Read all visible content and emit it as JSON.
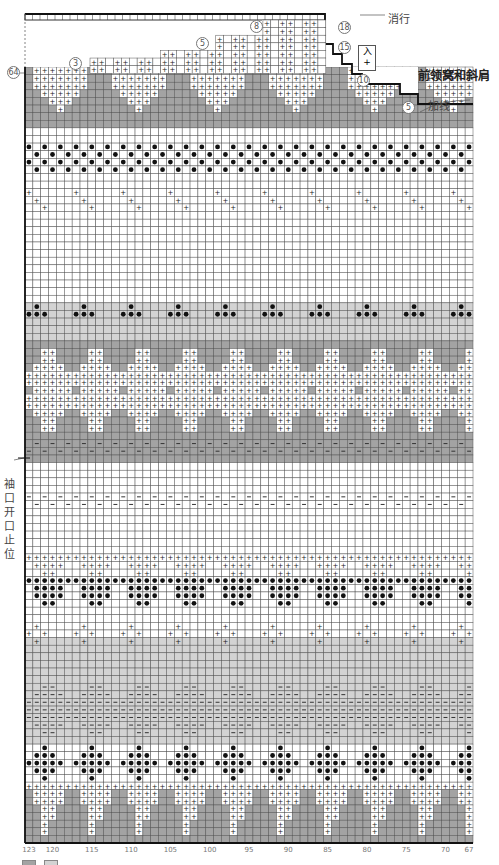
{
  "title": "前领窝和斜肩",
  "labels": {
    "bind_off_rows": "消行",
    "pick_up": "加线",
    "armhole_mark": "袖口开口止位"
  },
  "row_markers": [
    {
      "id": "m18",
      "text": "18"
    },
    {
      "id": "m15",
      "text": "15"
    },
    {
      "id": "m10",
      "text": "10"
    },
    {
      "id": "m5r",
      "text": "5"
    },
    {
      "id": "m8",
      "text": "8"
    },
    {
      "id": "m5",
      "text": "5"
    },
    {
      "id": "m3",
      "text": "3"
    },
    {
      "id": "m64",
      "text": "64"
    }
  ],
  "decrease_symbol": {
    "top": "入",
    "bottom": "+"
  },
  "stitch_numbers": [
    "123",
    "120",
    "115",
    "110",
    "105",
    "100",
    "95",
    "90",
    "85",
    "80",
    "75",
    "70",
    "67"
  ],
  "colors": {
    "dark_gray": "#a3a3a3",
    "light_gray": "#d3d3d3",
    "white": "#ffffff",
    "grid_line": "#555555",
    "dot": "#111111"
  },
  "symbols": {
    "plus": "+",
    "dot": "●",
    "dash": "−"
  },
  "chart_data": {
    "type": "heatmap",
    "columns": {
      "from": 123,
      "to": 67,
      "count": 57
    },
    "bands": [
      {
        "name": "bottom-diamonds",
        "background": "dark_gray",
        "motif": "white plus triangles"
      },
      {
        "name": "dot-diamonds",
        "background": "light_gray",
        "motif": "black dot diamonds"
      },
      {
        "name": "dash-waves",
        "background": "light_gray",
        "motif": "dash chevrons"
      },
      {
        "name": "plus-zigzag-lower",
        "background": "white",
        "motif": "plus zigzag"
      },
      {
        "name": "dot-waves",
        "background": "white",
        "motif": "black dot and plus waves"
      },
      {
        "name": "dash-rows",
        "background": "white",
        "motif": "dash pairs"
      },
      {
        "name": "dash-dark-rows",
        "background": "dark_gray",
        "motif": "dash pairs"
      },
      {
        "name": "plus-diamonds",
        "background": "dark_gray",
        "motif": "white plus diamonds"
      },
      {
        "name": "dot-triangles",
        "background": "light_gray",
        "motif": "small dot triangles"
      },
      {
        "name": "plus-zigzag-upper",
        "background": "white",
        "motif": "plus zigzag"
      },
      {
        "name": "dot-check",
        "background": "white",
        "motif": "alternating dots"
      },
      {
        "name": "top-triangles",
        "background": "dark_gray",
        "motif": "white plus triangles"
      }
    ]
  }
}
